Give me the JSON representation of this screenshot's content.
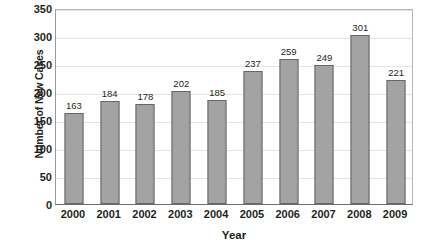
{
  "chart_data": {
    "type": "bar",
    "title": "",
    "subtitle": "",
    "xlabel": "Year",
    "ylabel": "Number of New Cases",
    "categories": [
      "2000",
      "2001",
      "2002",
      "2003",
      "2004",
      "2005",
      "2006",
      "2007",
      "2008",
      "2009"
    ],
    "values": [
      163,
      184,
      178,
      202,
      185,
      237,
      259,
      249,
      301,
      221
    ],
    "data_labels": [
      "163",
      "184",
      "178",
      "202",
      "185",
      "237",
      "259",
      "249",
      "301",
      "221"
    ],
    "ylim": [
      0,
      350
    ],
    "ytick_step": 50,
    "ytick_labels": [
      "0",
      "50",
      "100",
      "150",
      "200",
      "250",
      "300",
      "350"
    ],
    "ytick_values": [
      0,
      50,
      100,
      150,
      200,
      250,
      300,
      350
    ],
    "grid": "horizontal",
    "legend": "none",
    "bar_fill_color": "#a3a3a3",
    "bar_border_color": "#666666",
    "gridline_color": "#e3e3e3",
    "axis_color": "#6d6d6d",
    "text_color": "#231f20",
    "background_color": "#ffffff"
  }
}
